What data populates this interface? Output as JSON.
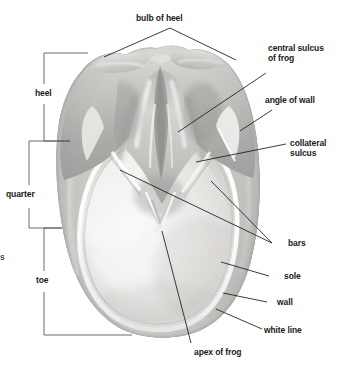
{
  "figure": {
    "view": "solar / ground surface view",
    "background_color": "#ffffff",
    "line_color": "#1a1a1a",
    "text_color": "#1a1a1a"
  },
  "labels": {
    "bulb_of_heel": "bulb of heel",
    "central_sulcus_of_frog_line1": "central sulcus",
    "central_sulcus_of_frog_line2": "of frog",
    "angle_of_wall": "angle of wall",
    "collateral_sulcus_line1": "collateral",
    "collateral_sulcus_line2": "sulcus",
    "bars": "bars",
    "sole": "sole",
    "wall": "wall",
    "white_line": "white line",
    "apex_of_frog": "apex of frog",
    "heel": "heel",
    "quarter": "quarter",
    "toe": "toe",
    "edge_clip": "s"
  },
  "brackets": [
    {
      "name": "heel",
      "label": "heel",
      "side": "left"
    },
    {
      "name": "quarter",
      "label": "quarter",
      "side": "left"
    },
    {
      "name": "toe",
      "label": "toe",
      "side": "left"
    }
  ],
  "callouts": [
    {
      "name": "bulb-of-heel",
      "label": "bulb of heel",
      "position": "top"
    },
    {
      "name": "central-sulcus-of-frog",
      "label": "central sulcus of frog",
      "position": "right"
    },
    {
      "name": "angle-of-wall",
      "label": "angle of wall",
      "position": "right"
    },
    {
      "name": "collateral-sulcus",
      "label": "collateral sulcus",
      "position": "right"
    },
    {
      "name": "bars",
      "label": "bars",
      "position": "right"
    },
    {
      "name": "sole",
      "label": "sole",
      "position": "right"
    },
    {
      "name": "wall",
      "label": "wall",
      "position": "right"
    },
    {
      "name": "white-line",
      "label": "white line",
      "position": "right"
    },
    {
      "name": "apex-of-frog",
      "label": "apex of frog",
      "position": "bottom"
    }
  ]
}
